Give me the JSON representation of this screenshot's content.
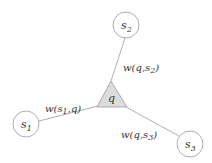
{
  "diagram": {
    "center_node": {
      "label": "q",
      "shape": "triangle",
      "fill": "#dcdcdc"
    },
    "nodes": [
      {
        "id": "s1",
        "base": "s",
        "sub": "1"
      },
      {
        "id": "s2",
        "base": "s",
        "sub": "2"
      },
      {
        "id": "s3",
        "base": "s",
        "sub": "3"
      }
    ],
    "edges": [
      {
        "from": "s1",
        "to": "q",
        "label_prefix": "w(",
        "label_a": "s",
        "label_a_sub": "1",
        "label_mid": ",",
        "label_b": "q",
        "label_suffix": ")"
      },
      {
        "from": "q",
        "to": "s2",
        "label_prefix": "w(",
        "label_a": "q",
        "label_mid": ",",
        "label_b": "s",
        "label_b_sub": "2",
        "label_suffix": ")"
      },
      {
        "from": "q",
        "to": "s3",
        "label_prefix": "w(",
        "label_a": "q",
        "label_mid": ",",
        "label_b": "s",
        "label_b_sub": "3",
        "label_suffix": ")"
      }
    ],
    "colors": {
      "line": "#999999",
      "text": "#333333",
      "triangle_fill": "#dcdcdc"
    }
  }
}
